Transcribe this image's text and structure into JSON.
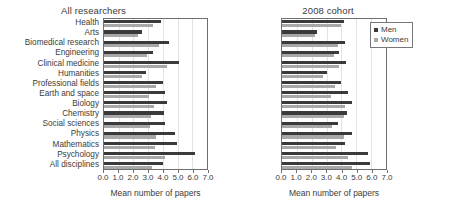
{
  "chart_data": {
    "type": "bar",
    "orientation": "horizontal",
    "title": "",
    "xlabel": "Mean number of papers",
    "ylabel": "",
    "xlim": [
      0.0,
      7.0
    ],
    "xticks": [
      "0.0",
      "1.0",
      "2.0",
      "3.0",
      "4.0",
      "5.0",
      "6.0",
      "7.0"
    ],
    "grid": true,
    "legend": {
      "position": "top-right-of-second-panel",
      "entries": [
        {
          "name": "Men",
          "color": "#3a3a3a"
        },
        {
          "name": "Women",
          "color": "#a8a8a8"
        }
      ]
    },
    "categories": [
      "Health",
      "Arts",
      "Biomedical research",
      "Engineering",
      "Clinical medicine",
      "Humanities",
      "Professional fields",
      "Earth and space",
      "Biology",
      "Chemistry",
      "Social sciences",
      "Physics",
      "Mathematics",
      "Psychology",
      "All disciplines"
    ],
    "panels": [
      {
        "title": "All researchers",
        "series": [
          {
            "name": "Men",
            "color": "#3a3a3a",
            "values": [
              3.85,
              2.55,
              4.45,
              3.3,
              5.1,
              2.85,
              4.0,
              4.15,
              4.3,
              4.1,
              4.15,
              4.85,
              4.95,
              6.2,
              4.0
            ]
          },
          {
            "name": "Women",
            "color": "#a8a8a8",
            "values": [
              3.3,
              2.3,
              3.75,
              2.9,
              4.3,
              2.55,
              3.5,
              3.05,
              3.4,
              3.2,
              3.15,
              3.5,
              3.45,
              4.15,
              3.25
            ]
          }
        ]
      },
      {
        "title": "2008 cohort",
        "series": [
          {
            "name": "Men",
            "color": "#3a3a3a",
            "values": [
              4.2,
              2.35,
              4.25,
              3.85,
              4.3,
              3.05,
              4.0,
              4.45,
              4.7,
              4.4,
              3.8,
              4.7,
              4.25,
              5.8,
              5.9
            ]
          },
          {
            "name": "Women",
            "color": "#a8a8a8",
            "values": [
              3.95,
              2.25,
              3.8,
              3.5,
              3.85,
              2.75,
              3.55,
              3.3,
              4.25,
              4.15,
              3.35,
              4.2,
              3.65,
              4.45,
              4.7
            ]
          }
        ]
      }
    ],
    "note_last_row": {
      "category": "All disciplines",
      "panel2_men": 4.15,
      "panel2_women": 4.15
    }
  }
}
